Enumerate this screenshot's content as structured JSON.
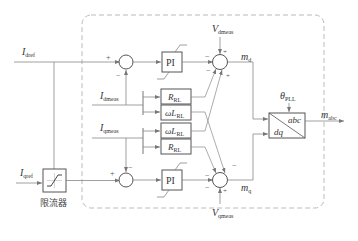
{
  "diagram": {
    "type": "current-control-block-diagram",
    "inputs": {
      "idref": {
        "main": "I",
        "sub": "dref"
      },
      "iqref": {
        "main": "I",
        "sub": "qref"
      },
      "idmeas": {
        "main": "I",
        "sub": "dmeas"
      },
      "iqmeas": {
        "main": "I",
        "sub": "qmeas"
      },
      "vdmeas": {
        "main": "V",
        "sub": "dmeas"
      },
      "vqmeas": {
        "main": "V",
        "sub": "qmeas"
      },
      "theta": {
        "main": "θ",
        "sub": "PLL"
      }
    },
    "outputs": {
      "md": {
        "main": "m",
        "sub": "d"
      },
      "mq": {
        "main": "m",
        "sub": "q"
      },
      "mabc": {
        "main": "m",
        "sub": "abc"
      }
    },
    "blocks": {
      "pi_d": "PI",
      "pi_q": "PI",
      "r1": {
        "main": "R",
        "sub": "RL"
      },
      "wl1": {
        "main": "ωL",
        "sub": "RL"
      },
      "wl2": {
        "main": "ωL",
        "sub": "RL"
      },
      "r2": {
        "main": "R",
        "sub": "RL"
      },
      "transform_top": "abc",
      "transform_bottom": "dq",
      "limiter_label": "限流器"
    },
    "signs": {
      "plus": "+",
      "minus": "−"
    }
  }
}
